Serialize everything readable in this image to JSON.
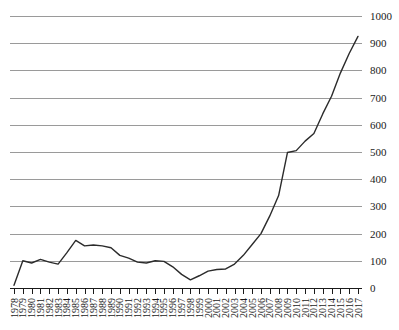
{
  "chart_data": {
    "type": "line",
    "title": "",
    "subtitle": "",
    "xlabel": "",
    "ylabel": "",
    "xlim": [
      1978,
      2017
    ],
    "ylim": [
      0,
      1000
    ],
    "ytick_labels": [
      "0",
      "100",
      "200",
      "300",
      "400",
      "500",
      "600",
      "700",
      "800",
      "900",
      "1000"
    ],
    "yticks": [
      0,
      100,
      200,
      300,
      400,
      500,
      600,
      700,
      800,
      900,
      1000
    ],
    "grid": "horizontal",
    "legend": "none",
    "categories": [
      "1978",
      "1979",
      "1980",
      "1981",
      "1982",
      "1983",
      "1984",
      "1985",
      "1986",
      "1987",
      "1988",
      "1989",
      "1990",
      "1991",
      "1992",
      "1993",
      "1994",
      "1995",
      "1996",
      "1997",
      "1998",
      "1999",
      "2000",
      "2001",
      "2002",
      "2003",
      "2004",
      "2005",
      "2006",
      "2007",
      "2008",
      "2009",
      "2010",
      "2011",
      "2012",
      "2013",
      "2014",
      "2015",
      "2016",
      "2017"
    ],
    "values": [
      10,
      100,
      92,
      105,
      95,
      88,
      130,
      175,
      155,
      158,
      155,
      148,
      120,
      110,
      95,
      92,
      100,
      98,
      78,
      50,
      30,
      45,
      62,
      68,
      70,
      88,
      120,
      160,
      200,
      265,
      340,
      498,
      505,
      540,
      568,
      640,
      705,
      790,
      862,
      925
    ],
    "series_name": "value"
  }
}
